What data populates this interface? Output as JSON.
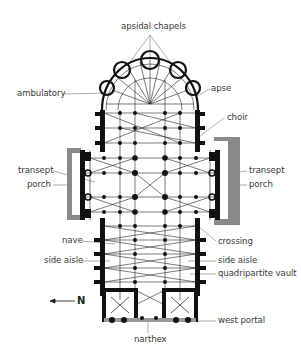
{
  "diagram": {
    "type": "architectural-floor-plan",
    "colors": {
      "ink": "#1a1a1a",
      "line": "#555555",
      "wall_gray": "#7a7a7a",
      "porch_fill": "#9a9a9a",
      "label": "#3a3a3a"
    },
    "labels": {
      "apsidal_chapels": "apsidal chapels",
      "ambulatory": "ambulatory",
      "apse": "apse",
      "choir": "choir",
      "transept_left": "transept",
      "porch_left": "porch",
      "transept_right": "transept",
      "porch_right": "porch",
      "nave": "nave",
      "crossing": "crossing",
      "side_aisle_left": "side aisle",
      "side_aisle_right": "side aisle",
      "quadripartite_vault": "quadripartite vault",
      "west_portal": "west portal",
      "narthex": "narthex"
    },
    "compass": {
      "arrow": "←",
      "direction": "N"
    }
  }
}
